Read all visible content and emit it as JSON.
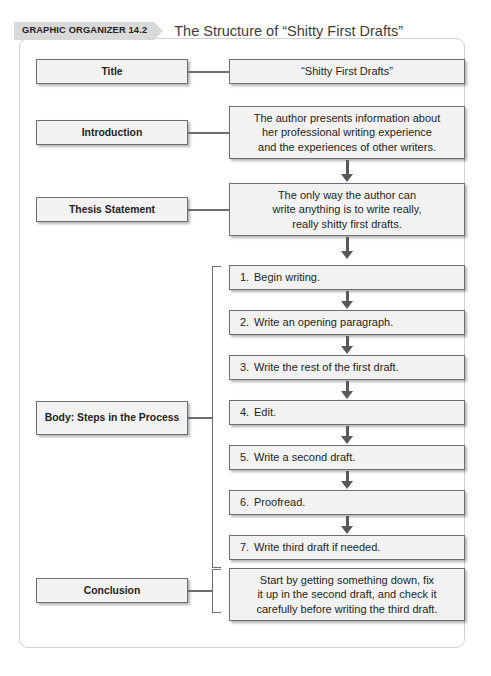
{
  "header": {
    "badge_label": "GRAPHIC ORGANIZER 14.2",
    "title": "The Structure of “Shitty First Drafts”"
  },
  "sections": [
    {
      "label": "Title",
      "content": "“Shitty First Drafts”"
    },
    {
      "label": "Introduction",
      "content": "The author presents information about her professional writing experience and the experiences of other writers."
    },
    {
      "label": "Thesis Statement",
      "content": "The only way the author can write anything is to write really, really shitty first drafts."
    },
    {
      "label": "Body: Steps in the Process",
      "content": ""
    },
    {
      "label": "Conclusion",
      "content": "Start by getting something down, fix it up in the second draft, and check it carefully before writing the third draft."
    }
  ],
  "intro_lines": {
    "l1": "The author presents information about",
    "l2": "her professional writing experience",
    "l3": "and the experiences of other writers."
  },
  "thesis_lines": {
    "l1": "The only way the author can",
    "l2": "write anything is to write really,",
    "l3": "really shitty first drafts."
  },
  "conclusion_lines": {
    "l1": "Start by getting something down, fix",
    "l2": "it up in the second draft, and check it",
    "l3": "carefully before writing the third draft."
  },
  "steps": [
    {
      "num": "1.",
      "text": "Begin writing."
    },
    {
      "num": "2.",
      "text": "Write an opening paragraph."
    },
    {
      "num": "3.",
      "text": "Write the rest of the first draft."
    },
    {
      "num": "4.",
      "text": "Edit."
    },
    {
      "num": "5.",
      "text": "Write a second draft."
    },
    {
      "num": "6.",
      "text": "Proofread."
    },
    {
      "num": "7.",
      "text": "Write third draft if needed."
    }
  ],
  "colors": {
    "box_fill": "#f2f2f2",
    "box_border": "#6d6e71",
    "badge_fill": "#d9d9d9",
    "frame_border": "#d2d2d2",
    "text": "#231f20"
  }
}
